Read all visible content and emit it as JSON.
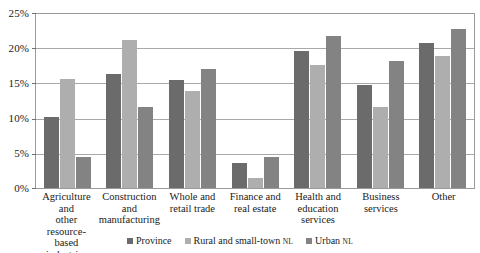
{
  "chart_data": {
    "type": "bar",
    "title": "",
    "subtitle": "",
    "xlabel": "",
    "ylabel": "",
    "ylim": [
      0,
      25
    ],
    "ytick_values": [
      25,
      20,
      15,
      10,
      5,
      0
    ],
    "ytick_labels": [
      "25%",
      "20%",
      "15%",
      "10%",
      "5%",
      "0%"
    ],
    "grid": true,
    "legend_position": "bottom-center",
    "value_suffix": "%",
    "categories": [
      "Agriculture and other resource-based industries",
      "Construction and manufacturing",
      "Whole and retail trade",
      "Finance and real estate",
      "Health and education services",
      "Business services",
      "Other"
    ],
    "category_lines": [
      [
        "Agriculture and",
        "other resource-",
        "based industries"
      ],
      [
        "Construction",
        "and",
        "manufacturing"
      ],
      [
        "Whole and",
        "retail trade"
      ],
      [
        "Finance and",
        "real estate"
      ],
      [
        "Health and",
        "education",
        "services"
      ],
      [
        "Business",
        "services"
      ],
      [
        "Other"
      ]
    ],
    "series": [
      {
        "name": "Province",
        "color": "#6b6b6b",
        "values": [
          10.2,
          16.4,
          15.5,
          3.6,
          19.7,
          14.8,
          20.8
        ]
      },
      {
        "name": "Rural and small-town NL",
        "name_main": "Rural and small-town ",
        "name_smallcaps": "NL",
        "color": "#aeaeae",
        "values": [
          15.7,
          21.2,
          14.0,
          1.5,
          17.7,
          11.7,
          19.0
        ]
      },
      {
        "name": "Urban NL",
        "name_main": "Urban ",
        "name_smallcaps": "NL",
        "color": "#838383",
        "values": [
          4.5,
          11.6,
          17.1,
          4.4,
          21.9,
          18.3,
          22.9
        ]
      }
    ]
  }
}
